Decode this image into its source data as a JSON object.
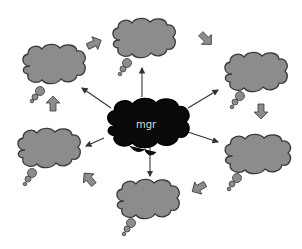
{
  "diagram": {
    "type": "cycle-around-hub",
    "center": {
      "label": "mgr",
      "fill": "#0a0a0a",
      "text_color": "#d8d8d8"
    },
    "nodes": [
      {
        "id": "top-left",
        "label": ""
      },
      {
        "id": "top",
        "label": ""
      },
      {
        "id": "right-upper",
        "label": ""
      },
      {
        "id": "right-lower",
        "label": ""
      },
      {
        "id": "bottom",
        "label": ""
      },
      {
        "id": "left-lower",
        "label": ""
      }
    ],
    "node_fill": "#8c8c8c",
    "node_stroke": "#3a3a3a",
    "block_arrow_fill": "#8c8c8c",
    "connector_color": "#333333",
    "cycle_direction": "clockwise"
  }
}
